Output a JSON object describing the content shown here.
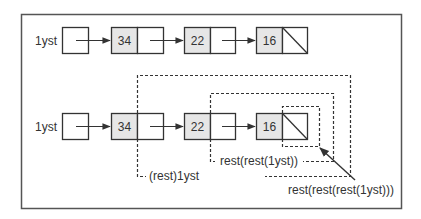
{
  "diagram": {
    "type": "linked-list-diagram",
    "colors": {
      "frame": "#555555",
      "node_value_fill": "#e6e6e6",
      "stroke": "#333333",
      "background": "#ffffff"
    },
    "rows": [
      {
        "id": "row1",
        "head_label": "1yst",
        "values": [
          "34",
          "22",
          "16"
        ]
      },
      {
        "id": "row2",
        "head_label": "1yst",
        "values": [
          "34",
          "22",
          "16"
        ]
      }
    ],
    "annotations": {
      "rest1": "(rest)1yst",
      "rest2": "rest(rest(1yst))",
      "rest3": "rest(rest(rest(1yst)))"
    }
  }
}
